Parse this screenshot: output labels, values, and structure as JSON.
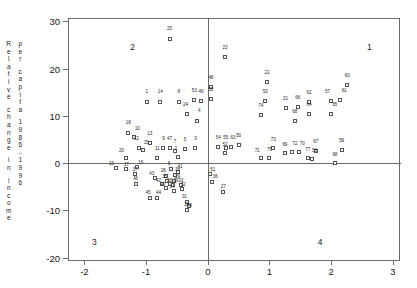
{
  "chart_data": {
    "type": "scatter",
    "title": "",
    "xlabel": "",
    "ylabel": "Relative change in income per capita 1986-1996",
    "ylabel_col1": "Relative change in income",
    "ylabel_col2": "per capita 1986-1996",
    "xlim": [
      -2.25,
      3.1
    ],
    "ylim": [
      -20.5,
      30.5
    ],
    "xticks": [
      -2,
      -1,
      0,
      1,
      2,
      3
    ],
    "xtick_labels": [
      "-2",
      "-1",
      "0",
      "1",
      "2",
      "3"
    ],
    "yticks": [
      -20,
      -10,
      0,
      10,
      20,
      30
    ],
    "ytick_labels": [
      "-20",
      "-10",
      "0",
      "10",
      "20",
      "30"
    ],
    "grid": false,
    "legend": "none",
    "zero_lines": {
      "x": 0,
      "y": 0
    },
    "marker": "open-square",
    "quadrant_labels": [
      {
        "label": "1",
        "x": 2.62,
        "y": 24.6
      },
      {
        "label": "2",
        "x": -1.22,
        "y": 24.6
      },
      {
        "label": "3",
        "x": -1.84,
        "y": -16.7
      },
      {
        "label": "4",
        "x": 1.82,
        "y": -16.7
      }
    ],
    "points": [
      {
        "id": "25",
        "x": -0.62,
        "y": 26.3,
        "lx": -0.62,
        "ly": 28.3
      },
      {
        "id": "23",
        "x": 0.28,
        "y": 22.4,
        "lx": 0.28,
        "ly": 24.4
      },
      {
        "id": "48",
        "x": 0.05,
        "y": 16.1,
        "lx": 0.05,
        "ly": 18.1
      },
      {
        "id": "58",
        "x": 0.05,
        "y": 13.6,
        "lx": 0.05,
        "ly": 15.4
      },
      {
        "id": "22",
        "x": 0.96,
        "y": 17.1,
        "lx": 0.96,
        "ly": 19.1
      },
      {
        "id": "60",
        "x": 2.26,
        "y": 16.5,
        "lx": 2.26,
        "ly": 18.5
      },
      {
        "id": "50",
        "x": 0.93,
        "y": 13.1,
        "lx": 0.93,
        "ly": 15.0
      },
      {
        "id": "1",
        "x": -0.99,
        "y": 13.0,
        "lx": -0.99,
        "ly": 15.0
      },
      {
        "id": "14",
        "x": -0.77,
        "y": 13.0,
        "lx": -0.77,
        "ly": 15.0
      },
      {
        "id": "8",
        "x": -0.47,
        "y": 13.0,
        "lx": -0.47,
        "ly": 15.0
      },
      {
        "id": "53",
        "x": -0.22,
        "y": 13.3,
        "lx": -0.22,
        "ly": 15.3
      },
      {
        "id": "46",
        "x": -0.11,
        "y": 13.1,
        "lx": -0.11,
        "ly": 15.1
      },
      {
        "id": "62",
        "x": 1.64,
        "y": 12.9,
        "lx": 1.64,
        "ly": 14.9
      },
      {
        "id": "57",
        "x": 2.0,
        "y": 13.1,
        "lx": 1.94,
        "ly": 15.1
      },
      {
        "id": "61",
        "x": 2.15,
        "y": 13.4,
        "lx": 2.21,
        "ly": 15.2
      },
      {
        "id": "21",
        "x": 1.26,
        "y": 11.6,
        "lx": 1.26,
        "ly": 13.5
      },
      {
        "id": "66",
        "x": 1.46,
        "y": 11.9,
        "lx": 1.46,
        "ly": 13.8
      },
      {
        "id": "24",
        "x": -0.33,
        "y": 10.3,
        "lx": -0.36,
        "ly": 12.3
      },
      {
        "id": "4",
        "x": -0.17,
        "y": 9.0,
        "lx": -0.14,
        "ly": 11.1
      },
      {
        "id": "64",
        "x": 1.64,
        "y": 10.3,
        "lx": 1.64,
        "ly": 12.2
      },
      {
        "id": "65",
        "x": 2.0,
        "y": 10.4,
        "lx": 2.06,
        "ly": 12.3
      },
      {
        "id": "74",
        "x": 0.86,
        "y": 10.1,
        "lx": 0.86,
        "ly": 12.0
      },
      {
        "id": "68",
        "x": 1.41,
        "y": 9.0,
        "lx": 1.41,
        "ly": 10.8
      },
      {
        "id": "18",
        "x": -1.29,
        "y": 6.4,
        "lx": -1.29,
        "ly": 8.4
      },
      {
        "id": "10",
        "x": -1.2,
        "y": 5.6,
        "lx": -1.14,
        "ly": 7.3
      },
      {
        "id": "13",
        "x": -0.94,
        "y": 4.2,
        "lx": -0.94,
        "ly": 6.1
      },
      {
        "id": "12",
        "x": -1.12,
        "y": 3.3,
        "lx": -1.16,
        "ly": 5.2
      },
      {
        "id": "15",
        "x": -1.05,
        "y": 2.7,
        "lx": -1.0,
        "ly": 4.2
      },
      {
        "id": "9",
        "x": -0.72,
        "y": 3.2,
        "lx": -0.72,
        "ly": 5.1
      },
      {
        "id": "47",
        "x": -0.62,
        "y": 3.2,
        "lx": -0.62,
        "ly": 5.1
      },
      {
        "id": "7",
        "x": -0.53,
        "y": 2.6,
        "lx": -0.53,
        "ly": 4.4
      },
      {
        "id": "5",
        "x": -0.37,
        "y": 2.9,
        "lx": -0.37,
        "ly": 4.8
      },
      {
        "id": "3",
        "x": -0.2,
        "y": 3.2,
        "lx": -0.2,
        "ly": 5.1
      },
      {
        "id": "2",
        "x": -0.49,
        "y": 1.3,
        "lx": -0.52,
        "ly": 3.0
      },
      {
        "id": "11",
        "x": -0.82,
        "y": 1.1,
        "lx": -0.82,
        "ly": 3.0
      },
      {
        "id": "20",
        "x": -1.33,
        "y": 1.0,
        "lx": -1.4,
        "ly": 2.6
      },
      {
        "id": "54",
        "x": 0.17,
        "y": 3.4,
        "lx": 0.17,
        "ly": 5.3
      },
      {
        "id": "55",
        "x": 0.29,
        "y": 3.3,
        "lx": 0.29,
        "ly": 5.3
      },
      {
        "id": "63",
        "x": 0.37,
        "y": 3.5,
        "lx": 0.41,
        "ly": 5.4
      },
      {
        "id": "50b",
        "x": 0.5,
        "y": 3.9,
        "lx": 0.5,
        "ly": 5.8
      },
      {
        "id": "52",
        "x": 0.28,
        "y": 2.2,
        "lx": 0.28,
        "ly": 3.8
      },
      {
        "id": "73",
        "x": 1.06,
        "y": 3.1,
        "lx": 1.06,
        "ly": 4.9
      },
      {
        "id": "69",
        "x": 1.25,
        "y": 2.1,
        "lx": 1.25,
        "ly": 3.9
      },
      {
        "id": "72",
        "x": 1.37,
        "y": 2.4,
        "lx": 1.41,
        "ly": 4.0
      },
      {
        "id": "70",
        "x": 1.48,
        "y": 2.3,
        "lx": 1.53,
        "ly": 4.0
      },
      {
        "id": "67",
        "x": 1.75,
        "y": 2.6,
        "lx": 1.75,
        "ly": 4.5
      },
      {
        "id": "59",
        "x": 2.17,
        "y": 2.8,
        "lx": 2.17,
        "ly": 4.7
      },
      {
        "id": "75",
        "x": 1.0,
        "y": 1.1,
        "lx": 1.0,
        "ly": 2.8
      },
      {
        "id": "71",
        "x": 0.86,
        "y": 1.0,
        "lx": 0.8,
        "ly": 2.5
      },
      {
        "id": "77",
        "x": 1.62,
        "y": 1.0,
        "lx": 1.62,
        "ly": 2.7
      },
      {
        "id": "56",
        "x": 1.69,
        "y": 0.9,
        "lx": 1.73,
        "ly": 2.6
      },
      {
        "id": "68b",
        "x": 2.06,
        "y": 0.1,
        "lx": 2.06,
        "ly": 1.8
      },
      {
        "id": "19",
        "x": -1.49,
        "y": -1.0,
        "lx": -1.56,
        "ly": -0.2
      },
      {
        "id": "17",
        "x": -1.32,
        "y": -1.3,
        "lx": -1.32,
        "ly": -0.3
      },
      {
        "id": "16",
        "x": -1.15,
        "y": -0.9,
        "lx": -1.09,
        "ly": 0.1
      },
      {
        "id": "37",
        "x": -1.18,
        "y": -2.4,
        "lx": -1.18,
        "ly": -1.4
      },
      {
        "id": "6",
        "x": -0.6,
        "y": -1.3,
        "lx": -0.63,
        "ly": -0.2
      },
      {
        "id": "41",
        "x": -0.49,
        "y": -1.9,
        "lx": -0.45,
        "ly": -0.8
      },
      {
        "id": "26",
        "x": -0.68,
        "y": -2.8,
        "lx": -0.72,
        "ly": -1.7
      },
      {
        "id": "38",
        "x": -0.53,
        "y": -2.6,
        "lx": -0.49,
        "ly": -1.5
      },
      {
        "id": "43",
        "x": -0.85,
        "y": -3.1,
        "lx": -0.91,
        "ly": -2.3
      },
      {
        "id": "35",
        "x": -0.66,
        "y": -3.8,
        "lx": -0.7,
        "ly": -3.0
      },
      {
        "id": "29",
        "x": -0.54,
        "y": -3.8,
        "lx": -0.49,
        "ly": -3.0
      },
      {
        "id": "42",
        "x": -0.74,
        "y": -4.4,
        "lx": -0.8,
        "ly": -3.7
      },
      {
        "id": "28",
        "x": -0.62,
        "y": -4.5,
        "lx": -0.62,
        "ly": -3.8
      },
      {
        "id": "39",
        "x": -0.57,
        "y": -4.6,
        "lx": -0.52,
        "ly": -3.8
      },
      {
        "id": "40",
        "x": -0.68,
        "y": -5.3,
        "lx": -0.73,
        "ly": -4.6
      },
      {
        "id": "34",
        "x": -0.55,
        "y": -5.8,
        "lx": -0.58,
        "ly": -5.0
      },
      {
        "id": "33",
        "x": -0.44,
        "y": -4.6,
        "lx": -0.44,
        "ly": -3.8
      },
      {
        "id": "32",
        "x": -0.42,
        "y": -5.4,
        "lx": -0.4,
        "ly": -4.6
      },
      {
        "id": "36",
        "x": 0.07,
        "y": -3.9,
        "lx": 0.12,
        "ly": -3.0
      },
      {
        "id": "51",
        "x": 0.03,
        "y": -2.3,
        "lx": 0.08,
        "ly": -1.4
      },
      {
        "id": "27",
        "x": 0.25,
        "y": -6.2,
        "lx": 0.25,
        "ly": -5.1
      },
      {
        "id": "45",
        "x": -0.94,
        "y": -7.3,
        "lx": -0.97,
        "ly": -6.3
      },
      {
        "id": "44",
        "x": -0.82,
        "y": -7.3,
        "lx": -0.8,
        "ly": -6.3
      },
      {
        "id": "46b",
        "x": -1.17,
        "y": -4.4,
        "lx": -1.17,
        "ly": -3.4
      },
      {
        "id": "31",
        "x": -0.34,
        "y": -8.2,
        "lx": -0.38,
        "ly": -7.2
      },
      {
        "id": "30",
        "x": -0.34,
        "y": -10.0,
        "lx": -0.34,
        "ly": -8.9
      },
      {
        "id": "49",
        "x": -0.3,
        "y": -9.1,
        "lx": -0.3,
        "ly": -9.1
      }
    ]
  }
}
